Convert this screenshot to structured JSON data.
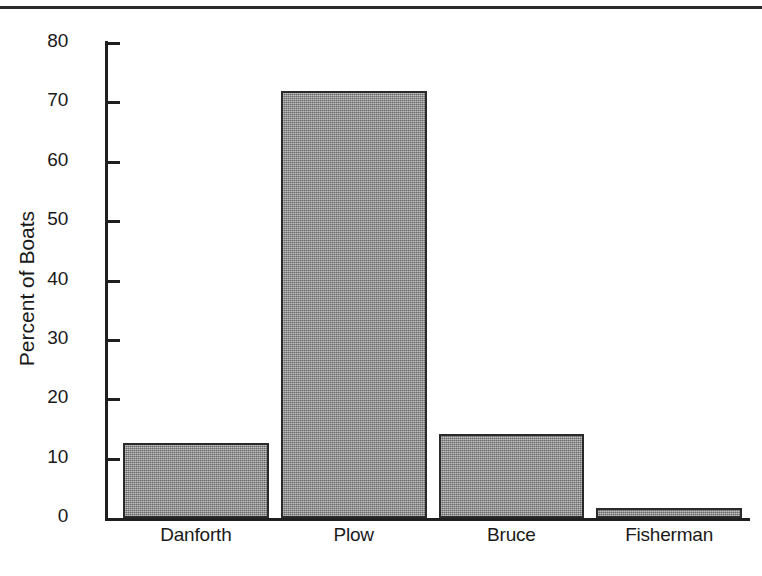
{
  "chart_data": {
    "type": "bar",
    "title": "",
    "xlabel": "",
    "ylabel": "Percent of Boats",
    "categories": [
      "Danforth",
      "Plow",
      "Bruce",
      "Fisherman"
    ],
    "values": [
      12.6,
      72,
      14.1,
      1.7
    ],
    "ylim": [
      0,
      80
    ],
    "yticks": [
      0,
      10,
      20,
      30,
      40,
      50,
      60,
      70,
      80
    ],
    "ytick_labels": [
      "0",
      "10",
      "20",
      "30",
      "40",
      "50",
      "60",
      "70",
      "80"
    ],
    "grid": false,
    "legend": null,
    "bar_color": "#8d8d8d",
    "bar_edge_color": "#2a2a2a",
    "axis_color": "#1f1f1f",
    "background_color": "#ffffff"
  },
  "figure": {
    "top_rule_color": "#2b2b2b"
  }
}
